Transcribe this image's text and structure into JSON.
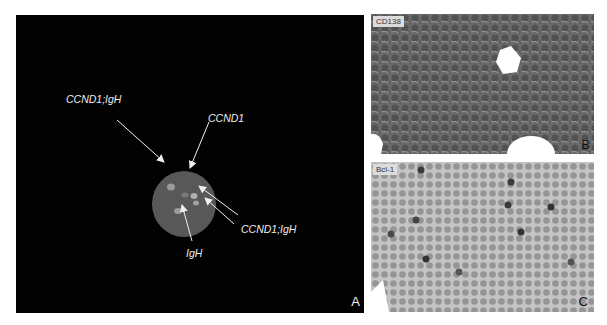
{
  "figure": {
    "panels": [
      {
        "id": "A",
        "letter": "A",
        "type": "FISH fluorescence micrograph",
        "labels": {
          "top_left": "CCND1;IgH",
          "top_center": "CCND1",
          "bottom_right": "CCND1;IgH",
          "bottom_center": "IgH"
        }
      },
      {
        "id": "B",
        "letter": "B",
        "type": "immunohistochemistry micrograph",
        "stain": "CD138"
      },
      {
        "id": "C",
        "letter": "C",
        "type": "immunohistochemistry micrograph",
        "stain": "Bcl-1"
      }
    ]
  },
  "colors": {
    "fish_background": "#020202",
    "nucleus": "#5a5a5a",
    "signal": "#a8a8a8",
    "annotation": "#eeeeee"
  }
}
